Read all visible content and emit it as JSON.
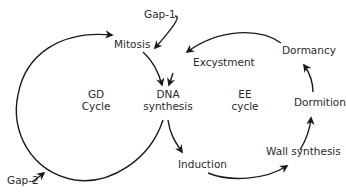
{
  "diagram": {
    "cycles": {
      "gd": {
        "line1": "GD",
        "line2": "Cycle"
      },
      "ee": {
        "line1": "EE",
        "line2": "cycle"
      }
    },
    "nodes": {
      "gap1": "Gap-1",
      "gap2": "Gap-2",
      "mitosis": "Mitosis",
      "excystment": "Excystment",
      "dna_line1": "DNA",
      "dna_line2": "synthesis",
      "induction": "Induction",
      "wall_synthesis": "Wall synthesis",
      "dormition": "Dormition",
      "dormancy": "Dormancy"
    },
    "edges": [
      {
        "from": "Gap-2",
        "to": "Mitosis",
        "via": "GD Cycle arc"
      },
      {
        "from": "Mitosis",
        "to": "DNA synthesis"
      },
      {
        "from": "Gap-1",
        "to": "Mitosis side / DNA synthesis"
      },
      {
        "from": "Excystment",
        "to": "DNA synthesis"
      },
      {
        "from": "DNA synthesis",
        "to": "Gap-2",
        "via": "GD Cycle arc"
      },
      {
        "from": "DNA synthesis",
        "to": "Induction"
      },
      {
        "from": "Induction",
        "to": "Wall synthesis"
      },
      {
        "from": "Wall synthesis",
        "to": "Dormition"
      },
      {
        "from": "Dormition",
        "to": "Dormancy"
      },
      {
        "from": "Dormancy",
        "to": "Excystment"
      }
    ],
    "colors": {
      "line": "#1a1a1a",
      "text": "#2a2a2a",
      "background": "#ffffff"
    }
  }
}
